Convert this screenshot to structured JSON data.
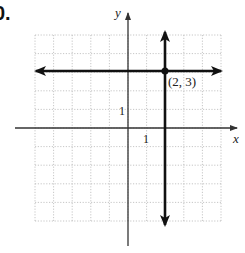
{
  "problem": {
    "number_label": "0."
  },
  "axes": {
    "x_label": "x",
    "y_label": "y",
    "x_tick_label": "1",
    "y_tick_label": "1"
  },
  "point": {
    "label": "(2, 3)",
    "x": 2,
    "y": 3
  },
  "colors": {
    "line": "#111111",
    "axis": "#333333",
    "grid": "#b8b8b8"
  },
  "chart_data": {
    "type": "line",
    "title": "",
    "xlabel": "x",
    "ylabel": "y",
    "xlim": [
      -5,
      5
    ],
    "ylim": [
      -5,
      5
    ],
    "grid": true,
    "grid_step": 1,
    "tick_labels": {
      "x": [
        "1"
      ],
      "y": [
        "1"
      ]
    },
    "series": [
      {
        "name": "horizontal line y = 3",
        "kind": "horizontal",
        "equation": "y = 3",
        "arrows": "both"
      },
      {
        "name": "vertical line x = 2",
        "kind": "vertical",
        "equation": "x = 2",
        "arrows": "both"
      }
    ],
    "points": [
      {
        "x": 2,
        "y": 3,
        "label": "(2, 3)"
      }
    ],
    "annotations": [
      "(2, 3)"
    ]
  }
}
